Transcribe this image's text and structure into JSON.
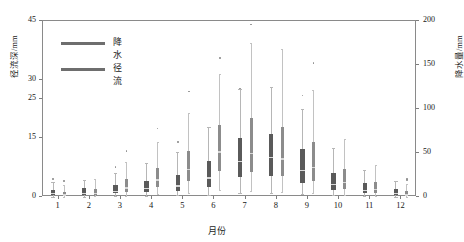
{
  "chart_data": {
    "type": "box",
    "title": "",
    "xlabel": "月份",
    "ylabel_left": "径流深/mm",
    "ylabel_right": "降水量/mm",
    "grid": false,
    "legend_position": "top-left",
    "categories": [
      "1",
      "2",
      "3",
      "4",
      "5",
      "6",
      "7",
      "8",
      "9",
      "10",
      "11",
      "12"
    ],
    "xtick_labels": [
      "1",
      "2",
      "3",
      "4",
      "5",
      "6",
      "7",
      "8",
      "9",
      "10",
      "11",
      "12"
    ],
    "left_axis": {
      "label": "径流深/mm",
      "ylim": [
        0,
        45
      ],
      "ticks": [
        0,
        15,
        25,
        30,
        45
      ],
      "tick_labels": [
        "0",
        "15",
        "25",
        "30",
        "45"
      ]
    },
    "right_axis": {
      "label": "降水量/mm",
      "ylim": [
        0,
        200
      ],
      "ticks": [
        0,
        50,
        100,
        150,
        200
      ],
      "tick_labels": [
        "0",
        "50",
        "100",
        "150",
        "200"
      ]
    },
    "legend": [
      {
        "name": "降水",
        "color": "#6e6e6e"
      },
      {
        "name": "径流",
        "color": "#6e6e6e"
      }
    ],
    "series": [
      {
        "name": "径流",
        "unit": "mm",
        "axis": "left",
        "color": "#5e5e5e",
        "boxes": [
          {
            "month": "1",
            "whisker_low": 0.1,
            "q1": 0.5,
            "median": 1.0,
            "q3": 1.9,
            "whisker_high": 3.9,
            "outliers": [
              4.6
            ]
          },
          {
            "month": "2",
            "whisker_low": 0.1,
            "q1": 0.6,
            "median": 1.1,
            "q3": 2.2,
            "whisker_high": 4.4,
            "outliers": []
          },
          {
            "month": "3",
            "whisker_low": 0.2,
            "q1": 0.9,
            "median": 1.6,
            "q3": 3.0,
            "whisker_high": 6.2,
            "outliers": [
              7.6
            ]
          },
          {
            "month": "4",
            "whisker_low": 0.3,
            "q1": 1.2,
            "median": 2.3,
            "q3": 4.2,
            "whisker_high": 8.6,
            "outliers": []
          },
          {
            "month": "5",
            "whisker_low": 0.4,
            "q1": 1.6,
            "median": 3.0,
            "q3": 5.6,
            "whisker_high": 11.4,
            "outliers": [
              14.1
            ]
          },
          {
            "month": "6",
            "whisker_low": 0.6,
            "q1": 2.6,
            "median": 5.0,
            "q3": 9.3,
            "whisker_high": 18.0,
            "outliers": []
          },
          {
            "month": "7",
            "whisker_low": 1.0,
            "q1": 5.0,
            "median": 9.3,
            "q3": 15.0,
            "whisker_high": 27.5,
            "outliers": [
              27.7
            ]
          },
          {
            "month": "8",
            "whisker_low": 1.1,
            "q1": 5.4,
            "median": 10.2,
            "q3": 16.2,
            "whisker_high": 28.0,
            "outliers": []
          },
          {
            "month": "9",
            "whisker_low": 0.8,
            "q1": 3.6,
            "median": 7.0,
            "q3": 12.4,
            "whisker_high": 22.6,
            "outliers": [
              26.0
            ]
          },
          {
            "month": "10",
            "whisker_low": 0.4,
            "q1": 1.8,
            "median": 3.4,
            "q3": 6.2,
            "whisker_high": 12.5,
            "outliers": []
          },
          {
            "month": "11",
            "whisker_low": 0.2,
            "q1": 1.0,
            "median": 1.9,
            "q3": 3.5,
            "whisker_high": 7.0,
            "outliers": []
          },
          {
            "month": "12",
            "whisker_low": 0.1,
            "q1": 0.6,
            "median": 1.1,
            "q3": 2.1,
            "whisker_high": 4.2,
            "outliers": []
          }
        ]
      },
      {
        "name": "降水",
        "unit": "mm",
        "axis": "right",
        "color": "#7a7a7a",
        "boxes": [
          {
            "month": "1",
            "whisker_low": 0.5,
            "q1": 1.5,
            "median": 3.0,
            "q3": 6.0,
            "whisker_high": 14.0,
            "outliers": [
              18.0
            ]
          },
          {
            "month": "2",
            "whisker_low": 0.8,
            "q1": 2.5,
            "median": 5.0,
            "q3": 9.5,
            "whisker_high": 21.0,
            "outliers": []
          },
          {
            "month": "3",
            "whisker_low": 1.5,
            "q1": 6.0,
            "median": 11.0,
            "q3": 20.0,
            "whisker_high": 40.0,
            "outliers": [
              52.0
            ]
          },
          {
            "month": "4",
            "whisker_low": 3.0,
            "q1": 11.0,
            "median": 20.0,
            "q3": 33.0,
            "whisker_high": 62.0,
            "outliers": [
              78.0
            ]
          },
          {
            "month": "5",
            "whisker_low": 5.0,
            "q1": 18.0,
            "median": 32.0,
            "q3": 52.0,
            "whisker_high": 95.0,
            "outliers": [
              120.0
            ]
          },
          {
            "month": "6",
            "whisker_low": 8.0,
            "q1": 30.0,
            "median": 52.0,
            "q3": 82.0,
            "whisker_high": 140.0,
            "outliers": [
              158.0
            ]
          },
          {
            "month": "7",
            "whisker_low": 7.0,
            "q1": 28.0,
            "median": 50.0,
            "q3": 90.0,
            "whisker_high": 175.0,
            "outliers": [
              196.0
            ]
          },
          {
            "month": "8",
            "whisker_low": 6.0,
            "q1": 24.0,
            "median": 44.0,
            "q3": 80.0,
            "whisker_high": 168.0,
            "outliers": []
          },
          {
            "month": "9",
            "whisker_low": 4.0,
            "q1": 18.0,
            "median": 34.0,
            "q3": 62.0,
            "whisker_high": 122.0,
            "outliers": [
              152.0
            ]
          },
          {
            "month": "10",
            "whisker_low": 2.0,
            "q1": 9.0,
            "median": 17.0,
            "q3": 32.0,
            "whisker_high": 66.0,
            "outliers": []
          },
          {
            "month": "11",
            "whisker_low": 1.0,
            "q1": 4.5,
            "median": 9.0,
            "q3": 17.0,
            "whisker_high": 36.0,
            "outliers": []
          },
          {
            "month": "12",
            "whisker_low": 0.4,
            "q1": 1.6,
            "median": 3.2,
            "q3": 6.5,
            "whisker_high": 15.0,
            "outliers": [
              19.0,
              20.5
            ]
          }
        ]
      }
    ]
  }
}
